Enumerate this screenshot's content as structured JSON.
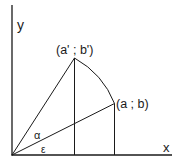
{
  "diagram": {
    "title": "",
    "axes": {
      "x_label": "x",
      "y_label": "y"
    },
    "points": [
      {
        "id": "rotated",
        "label": "(a' ; b')"
      },
      {
        "id": "original",
        "label": "(a ; b)"
      }
    ],
    "angles": [
      {
        "id": "alpha",
        "label": "α"
      },
      {
        "id": "epsilon",
        "label": "ε"
      }
    ],
    "colors": {
      "stroke": "#1a1a1a",
      "background": "#ffffff"
    }
  }
}
